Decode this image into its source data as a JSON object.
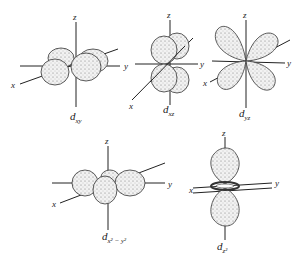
{
  "orbitals": [
    {
      "id": "dxy",
      "label_main": "d",
      "label_sub": "xy",
      "axes": {
        "x": "x",
        "y": "y",
        "z": "z"
      }
    },
    {
      "id": "dxz",
      "label_main": "d",
      "label_sub": "xz",
      "axes": {
        "x": "x",
        "y": "y",
        "z": "z"
      }
    },
    {
      "id": "dyz",
      "label_main": "d",
      "label_sub": "yz",
      "axes": {
        "x": "x",
        "y": "y",
        "z": "z"
      }
    },
    {
      "id": "dx2y2",
      "label_main": "d",
      "label_sub": "x² − y²",
      "axes": {
        "x": "x",
        "y": "y",
        "z": "z"
      }
    },
    {
      "id": "dz2",
      "label_main": "d",
      "label_sub": "z²",
      "axes": {
        "x": "x",
        "y": "y",
        "z": "z"
      }
    }
  ]
}
